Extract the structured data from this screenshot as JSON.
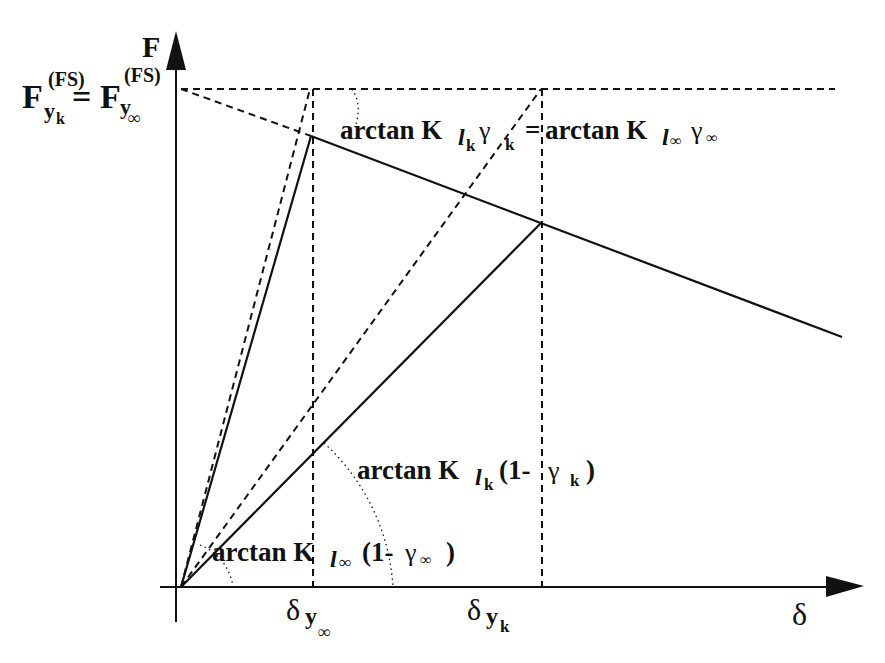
{
  "diagram": {
    "type": "force-displacement bilinear plot",
    "axes": {
      "y_label": "F",
      "x_label": "δ",
      "origin": [
        181,
        587
      ]
    },
    "labels": {
      "yield_force_left": {
        "main": "F",
        "sub": "y",
        "subsub": "k",
        "sup": "(FS)"
      },
      "equals": "=",
      "yield_force_right": {
        "main": "F",
        "sub": "y",
        "subsub": "∞",
        "sup": "(FS)"
      },
      "angle_top": {
        "lhs_prefix": "arctan K",
        "lhs_sub": "l",
        "lhs_subsub": "k",
        "lhs_gamma": "γ",
        "lhs_gamma_sub": "k",
        "equals": "=",
        "rhs_prefix": "arctan K",
        "rhs_sub": "l",
        "rhs_subsub": "∞",
        "rhs_gamma": "γ",
        "rhs_gamma_sub": "∞"
      },
      "angle_mid": {
        "prefix": "arctan K",
        "sub": "l",
        "subsub": "k",
        "open": "(1-",
        "gamma": "γ",
        "gamma_sub": "k",
        "close": ")"
      },
      "angle_low": {
        "prefix": "arctan K",
        "sub": "l",
        "subsub": "∞",
        "open": "(1-",
        "gamma": "γ",
        "gamma_sub": "∞",
        "close": ")"
      },
      "x_tick_1": {
        "main": "δ",
        "sub": "y",
        "subsub": "∞"
      },
      "x_tick_2": {
        "main": "δ",
        "sub": "y",
        "subsub": "k"
      }
    },
    "curves": [
      {
        "name": "stiff-elastic-branch",
        "style": "solid",
        "points": [
          [
            181,
            587
          ],
          [
            311,
            136
          ]
        ]
      },
      {
        "name": "stiff-post-yield-branch",
        "style": "solid",
        "points": [
          [
            311,
            136
          ],
          [
            842,
            337
          ]
        ]
      },
      {
        "name": "soft-elastic-branch",
        "style": "solid",
        "points": [
          [
            181,
            587
          ],
          [
            542,
            222
          ]
        ]
      },
      {
        "name": "yield-force-level",
        "style": "dashed",
        "points": [
          [
            181,
            89
          ],
          [
            835,
            89
          ]
        ]
      },
      {
        "name": "post-yield-projection",
        "style": "dashed",
        "points": [
          [
            181,
            89
          ],
          [
            311,
            136
          ]
        ]
      },
      {
        "name": "stiff-initial-stiffness",
        "style": "dashed",
        "points": [
          [
            181,
            587
          ],
          [
            310,
            89
          ]
        ]
      },
      {
        "name": "soft-initial-stiffness",
        "style": "dashed",
        "points": [
          [
            181,
            587
          ],
          [
            541,
            89
          ]
        ]
      },
      {
        "name": "delta-y-inf-guide",
        "style": "dashed",
        "points": [
          [
            313,
            89
          ],
          [
            313,
            587
          ]
        ]
      },
      {
        "name": "delta-y-k-guide",
        "style": "dashed",
        "points": [
          [
            542,
            89
          ],
          [
            542,
            587
          ]
        ]
      }
    ]
  }
}
